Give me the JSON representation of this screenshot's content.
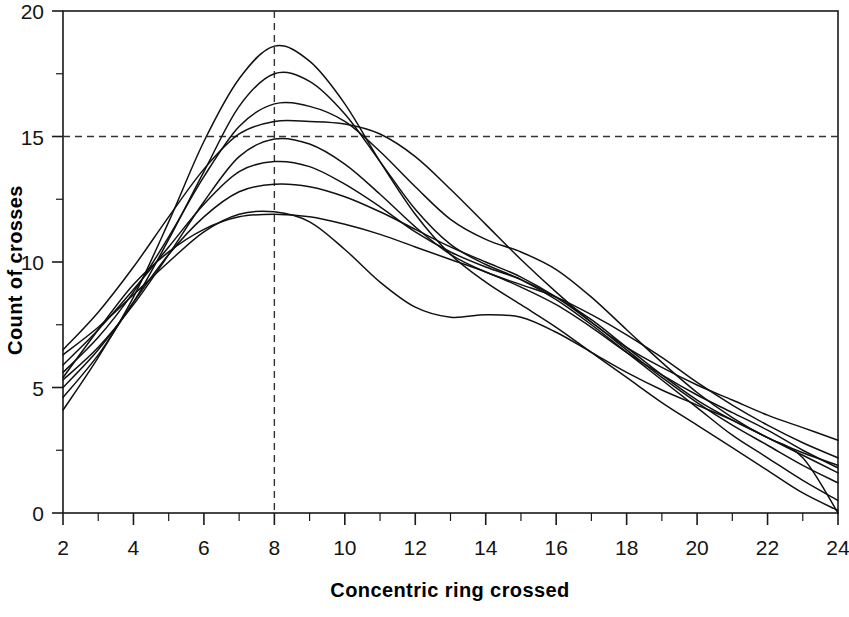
{
  "chart_data": {
    "type": "line",
    "title": "",
    "subtitle": "",
    "xlabel": "Concentric ring crossed",
    "ylabel": "Count of crosses",
    "xlim": [
      2,
      24
    ],
    "ylim": [
      0,
      20
    ],
    "grid": false,
    "legend": "none",
    "x_ticks_major": [
      2,
      4,
      6,
      8,
      10,
      12,
      14,
      16,
      18,
      20,
      22,
      24
    ],
    "x_ticks_minor": [
      3,
      5,
      7,
      9,
      11,
      13,
      15,
      17,
      19,
      21,
      23
    ],
    "y_ticks_major": [
      0,
      5,
      10,
      15,
      20
    ],
    "y_ticks_minor": [
      2.5,
      7.5,
      12.5,
      17.5
    ],
    "x_tick_labels": [
      "2",
      "4",
      "6",
      "8",
      "10",
      "12",
      "14",
      "16",
      "18",
      "20",
      "22",
      "24"
    ],
    "y_tick_labels": [
      "0",
      "5",
      "10",
      "15",
      "20"
    ],
    "annotations": [
      {
        "name": "vertical-reference-line",
        "orientation": "vertical",
        "value": 8,
        "style": "dashed"
      },
      {
        "name": "horizontal-reference-line",
        "orientation": "horizontal",
        "value": 15,
        "style": "dashed"
      }
    ],
    "x": [
      2,
      3,
      4,
      5,
      6,
      7,
      8,
      9,
      10,
      11,
      12,
      13,
      14,
      15,
      16,
      17,
      18,
      19,
      20,
      21,
      22,
      23,
      24
    ],
    "series": [
      {
        "name": "subject-1",
        "values": [
          4.1,
          6.2,
          8.6,
          11.6,
          14.8,
          17.3,
          18.6,
          18.0,
          16.3,
          14.0,
          11.9,
          10.3,
          9.2,
          8.3,
          7.4,
          6.4,
          5.4,
          4.4,
          3.5,
          2.6,
          1.7,
          0.8,
          0.1
        ]
      },
      {
        "name": "subject-2",
        "values": [
          5.0,
          6.5,
          8.4,
          10.9,
          13.6,
          16.2,
          17.5,
          17.2,
          15.9,
          14.0,
          12.1,
          10.7,
          9.9,
          9.3,
          8.5,
          7.5,
          6.4,
          5.3,
          4.2,
          3.1,
          2.2,
          1.3,
          0.5
        ]
      },
      {
        "name": "subject-3",
        "values": [
          5.6,
          7.0,
          8.8,
          11.0,
          13.4,
          15.4,
          16.3,
          16.2,
          15.6,
          14.4,
          13.0,
          11.7,
          10.9,
          10.4,
          9.7,
          8.6,
          7.3,
          6.0,
          4.8,
          3.8,
          3.0,
          2.4,
          1.9
        ]
      },
      {
        "name": "subject-4",
        "values": [
          6.5,
          8.0,
          9.8,
          11.8,
          13.7,
          15.1,
          15.6,
          15.6,
          15.5,
          15.1,
          14.2,
          12.9,
          11.5,
          10.1,
          8.8,
          7.6,
          6.6,
          5.8,
          5.1,
          4.5,
          3.9,
          3.4,
          2.9
        ]
      },
      {
        "name": "subject-5",
        "values": [
          5.3,
          6.6,
          8.3,
          10.3,
          12.4,
          14.2,
          14.9,
          14.7,
          13.9,
          12.7,
          11.4,
          10.3,
          9.6,
          9.1,
          8.6,
          7.9,
          7.1,
          6.2,
          5.2,
          4.3,
          3.5,
          2.8,
          2.2
        ]
      },
      {
        "name": "subject-6",
        "values": [
          5.9,
          7.3,
          8.9,
          10.6,
          12.3,
          13.6,
          14.0,
          13.8,
          13.1,
          12.2,
          11.2,
          10.4,
          9.8,
          9.3,
          8.6,
          7.7,
          6.6,
          5.5,
          4.5,
          3.7,
          3.0,
          2.3,
          1.6
        ]
      },
      {
        "name": "subject-7",
        "values": [
          4.6,
          6.3,
          8.4,
          10.3,
          11.8,
          12.8,
          13.1,
          13.0,
          12.6,
          12.0,
          11.3,
          10.6,
          10.0,
          9.4,
          8.6,
          7.6,
          6.5,
          5.4,
          4.4,
          3.5,
          2.7,
          1.9,
          1.2
        ]
      },
      {
        "name": "subject-8",
        "values": [
          5.4,
          7.3,
          9.1,
          10.4,
          11.3,
          11.8,
          11.9,
          11.8,
          11.5,
          11.1,
          10.6,
          10.1,
          9.6,
          9.0,
          8.3,
          7.4,
          6.4,
          5.5,
          4.7,
          4.0,
          3.3,
          2.5,
          1.8
        ]
      },
      {
        "name": "subject-9",
        "values": [
          6.3,
          7.4,
          8.7,
          10.0,
          11.2,
          11.9,
          12.0,
          11.6,
          10.5,
          9.2,
          8.2,
          7.8,
          7.9,
          7.8,
          7.2,
          6.4,
          5.6,
          4.9,
          4.3,
          3.7,
          3.0,
          2.2,
          0.0
        ]
      }
    ]
  }
}
